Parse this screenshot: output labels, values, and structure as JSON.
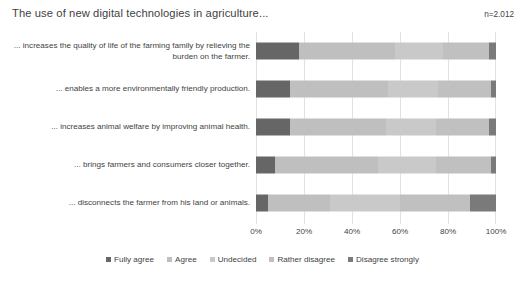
{
  "header": {
    "title": "The use of new digital technologies in agriculture...",
    "sample_size": "n=2.012"
  },
  "chart_data": {
    "type": "bar",
    "orientation": "horizontal",
    "stacked": true,
    "stacked_mode": "percent",
    "title": "The use of new digital technologies in agriculture...",
    "annotation": "n=2.012",
    "xlabel": "",
    "ylabel": "",
    "xlim": [
      0,
      100
    ],
    "xticks": [
      0,
      20,
      40,
      60,
      80,
      100
    ],
    "xtick_labels": [
      "0%",
      "20%",
      "40%",
      "60%",
      "80%",
      "100%"
    ],
    "grid": true,
    "legend_position": "bottom",
    "categories": [
      "... increases the quality of life of the farming family by relieving the burden on the farmer.",
      "... enables a more environmentally friendly production.",
      "... increases animal welfare by improving animal health.",
      "... brings farmers and consumers closer together.",
      "... disconnects the farmer from his land or animals."
    ],
    "series": [
      {
        "name": "Fully agree",
        "color": "#666666",
        "values": [
          18,
          14,
          14,
          8,
          5
        ]
      },
      {
        "name": "Agree",
        "color": "#bfbfbf",
        "values": [
          40,
          41,
          40,
          43,
          26
        ]
      },
      {
        "name": "Undecided",
        "color": "#c9c9c9",
        "values": [
          20,
          21,
          21,
          24,
          29
        ]
      },
      {
        "name": "Rather disagree",
        "color": "#c0c0c0",
        "values": [
          19,
          22,
          22,
          23,
          29
        ]
      },
      {
        "name": "Disagree strongly",
        "color": "#7a7a7a",
        "values": [
          3,
          2,
          3,
          2,
          11
        ]
      }
    ]
  }
}
